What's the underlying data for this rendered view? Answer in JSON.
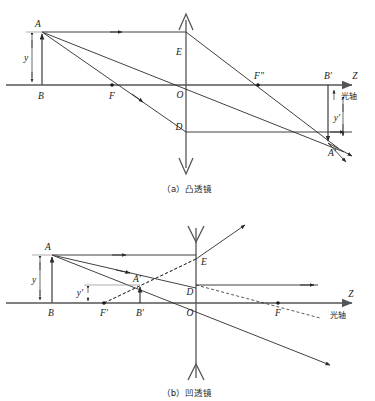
{
  "figure": {
    "axis_label": "Z",
    "optical_axis_label": "光轴"
  },
  "panels": [
    {
      "id": "convex",
      "caption": "（a）凸透镜",
      "caption_index": "（a）",
      "caption_name": "凸透镜",
      "lens_type": "convex",
      "axis_label": "Z",
      "optical_axis_label": "光轴",
      "points": [
        {
          "key": "A",
          "label": "A",
          "x": 42,
          "y": 32,
          "desc": "object-top"
        },
        {
          "key": "B",
          "label": "B",
          "x": 42,
          "y": 85,
          "desc": "object-base-on-axis"
        },
        {
          "key": "F",
          "label": "F",
          "x": 112,
          "y": 85,
          "desc": "front-focal-point"
        },
        {
          "key": "O",
          "label": "O",
          "x": 186,
          "y": 85,
          "desc": "lens-center"
        },
        {
          "key": "E",
          "label": "E",
          "x": 186,
          "y": 47,
          "desc": "lens-upper-vertex"
        },
        {
          "key": "D",
          "label": "D",
          "x": 186,
          "y": 132,
          "desc": "lens-lower-vertex"
        },
        {
          "key": "F2",
          "label": "F″",
          "x": 258,
          "y": 85,
          "desc": "rear-focal-point"
        },
        {
          "key": "Bp",
          "label": "B′",
          "x": 328,
          "y": 85,
          "desc": "image-base-on-axis"
        },
        {
          "key": "Ap",
          "label": "A′",
          "x": 328,
          "y": 143,
          "desc": "image-top"
        }
      ],
      "dimensions": [
        {
          "key": "y",
          "label": "y",
          "desc": "object-height"
        },
        {
          "key": "yp",
          "label": "y′",
          "desc": "image-height"
        }
      ]
    },
    {
      "id": "concave",
      "caption": "（b）凹透镜",
      "caption_index": "（b）",
      "caption_name": "凹透镜",
      "lens_type": "concave",
      "axis_label": "Z",
      "optical_axis_label": "光轴",
      "points": [
        {
          "key": "A",
          "label": "A",
          "x": 52,
          "y": 255,
          "desc": "object-top"
        },
        {
          "key": "B",
          "label": "B",
          "x": 52,
          "y": 303,
          "desc": "object-base-on-axis"
        },
        {
          "key": "Fp",
          "label": "F′",
          "x": 104,
          "y": 303,
          "desc": "front-focal-point"
        },
        {
          "key": "Ap",
          "label": "A′",
          "x": 140,
          "y": 285,
          "desc": "virtual-image-top"
        },
        {
          "key": "Bp",
          "label": "B′",
          "x": 140,
          "y": 303,
          "desc": "virtual-image-base-on-axis"
        },
        {
          "key": "O",
          "label": "O",
          "x": 196,
          "y": 303,
          "desc": "lens-center"
        },
        {
          "key": "D",
          "label": "D",
          "x": 196,
          "y": 288,
          "desc": "lens-axis-upper-mark"
        },
        {
          "key": "E",
          "label": "E",
          "x": 196,
          "y": 259,
          "desc": "lens-upper-ray-point"
        },
        {
          "key": "F",
          "label": "F",
          "x": 278,
          "y": 303,
          "desc": "rear-focal-point"
        }
      ],
      "dimensions": [
        {
          "key": "y",
          "label": "y",
          "desc": "object-height"
        },
        {
          "key": "yp",
          "label": "y′",
          "desc": "virtual-image-height"
        }
      ]
    }
  ],
  "colors": {
    "ink": "#1a1a1a",
    "ray": "#2b2b2b",
    "axis": "#555555",
    "thin": "#8a8a8a",
    "background": "#ffffff"
  }
}
